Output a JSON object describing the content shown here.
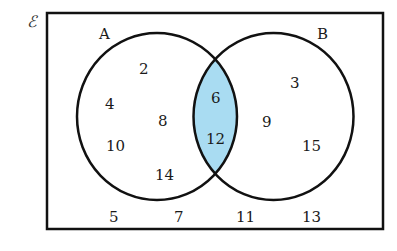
{
  "diagram": {
    "type": "venn",
    "universal_symbol": "ℰ",
    "shaded_region": "A ∩ B",
    "colors": {
      "shade": "#a9dcf2",
      "stroke": "#111111",
      "background": "#ffffff"
    },
    "sets": [
      {
        "name": "A",
        "label": "A"
      },
      {
        "name": "B",
        "label": "B"
      }
    ],
    "regions": {
      "a_only": [
        "2",
        "4",
        "8",
        "10",
        "14"
      ],
      "intersection": [
        "6",
        "12"
      ],
      "b_only": [
        "3",
        "9",
        "15"
      ],
      "outside": [
        "5",
        "7",
        "11",
        "13"
      ]
    }
  }
}
